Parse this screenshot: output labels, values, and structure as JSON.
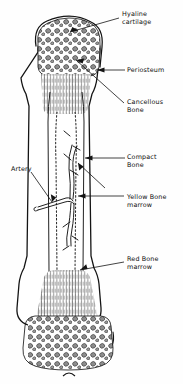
{
  "figure": {
    "background_color": "#fefefe",
    "ink_color": "#111111",
    "width": 183,
    "height": 384
  },
  "labels": {
    "hyaline_cartilage": "Hyaline\ncartilage",
    "periosteum": "Periosteum",
    "cancellous_bone": "Cancellous\nBone",
    "compact_bone": "Compact\nBone",
    "artery": "Artery",
    "yellow_bone_marrow": "Yellow Bone\nmarrow",
    "red_bone_marrow": "Red  Bone\nmarrow"
  },
  "structures": [
    {
      "name": "hyaline-cartilage",
      "region": "proximal-epiphysis-outer-surface"
    },
    {
      "name": "periosteum",
      "region": "outer-shaft-membrane"
    },
    {
      "name": "cancellous-bone",
      "region": "proximal-epiphysis-trabeculae"
    },
    {
      "name": "compact-bone",
      "region": "diaphysis-cortical-wall"
    },
    {
      "name": "artery",
      "region": "nutrient-vessel-entering-medullary-cavity"
    },
    {
      "name": "yellow-bone-marrow",
      "region": "medullary-cavity-center"
    },
    {
      "name": "red-bone-marrow",
      "region": "distal-metaphysis-marrow"
    }
  ]
}
